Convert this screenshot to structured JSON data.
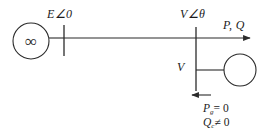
{
  "diagram": {
    "type": "power-system-one-line-diagram",
    "stroke_color": "#2b2b2b",
    "text_color": "#1b1b1b",
    "background_color": "#ffffff",
    "labels": {
      "source_voltage": "E∠0",
      "bus_voltage_angle": "V∠θ",
      "power_flow": "P, Q",
      "bus_voltage": "V",
      "real_power_gen": "P",
      "real_power_gen_sub": "g",
      "real_power_gen_value": "= 0",
      "reactive_power_cond": "Q",
      "reactive_power_cond_sub": "c",
      "reactive_power_cond_value": "≠ 0"
    },
    "symbols": {
      "infinite_bus": "∞",
      "generator_symbol_name": "infinite-bus-source",
      "condenser_symbol_name": "synchronous-condenser"
    },
    "geometry": {
      "source_circle": {
        "cx": 31,
        "cy": 41,
        "r": 18
      },
      "left_bus_bar": {
        "x": 64,
        "y1": 26,
        "y2": 56
      },
      "transmission_line": {
        "x1": 64,
        "y1": 38,
        "x2": 196,
        "y2": 38
      },
      "right_bus_bar": {
        "x": 196,
        "y1": 27,
        "y2": 91
      },
      "outgoing_line": {
        "x1": 196,
        "y1": 38,
        "x2": 252,
        "y2": 38
      },
      "branch_line": {
        "x1": 196,
        "y1": 70,
        "x2": 224,
        "y2": 70
      },
      "condenser_circle": {
        "cx": 240,
        "cy": 70,
        "r": 16
      },
      "load_arrow": {
        "x1": 209,
        "y1": 95,
        "x2": 190,
        "y2": 95
      }
    }
  }
}
